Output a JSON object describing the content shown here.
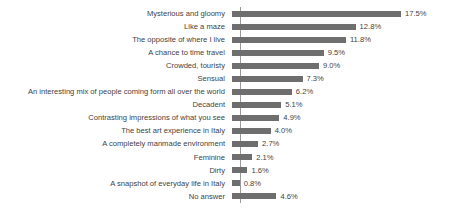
{
  "chart_data": {
    "type": "bar",
    "orientation": "horizontal",
    "title": "",
    "subtitle": "",
    "xlabel": "",
    "ylabel": "",
    "grid": false,
    "legend": false,
    "axis_line": "vertical-left-only",
    "value_label_suffix": "%",
    "xlim": [
      0,
      17.5
    ],
    "bar_color": "#6e6e6e",
    "axis_color": "#9a9a9a",
    "text_color": "#3f3f3f",
    "background": "#ffffff",
    "categories": [
      "Mysterious and gloomy",
      "Like a maze",
      "The opposite of where I live",
      "A chance to time travel",
      "Crowded, touristy",
      "Sensual",
      "An interesting mix of people coming form all over the world",
      "Decadent",
      "Contrasting impressions of what you see",
      "The best art experience in Italy",
      "A completely manmade environment",
      "Feminine",
      "Dirty",
      "A snapshot of everyday life in Italy",
      "No answer"
    ],
    "values": [
      17.5,
      12.8,
      11.8,
      9.5,
      9.0,
      7.3,
      6.2,
      5.1,
      4.9,
      4.0,
      2.7,
      2.1,
      1.6,
      0.8,
      4.6
    ],
    "value_labels": [
      "17.5%",
      "12.8%",
      "11.8%",
      "9.5%",
      "9.0%",
      "7.3%",
      "6.2%",
      "5.1%",
      "4.9%",
      "4.0%",
      "2.7%",
      "2.1%",
      "1.6%",
      "0.8%",
      "4.6%"
    ]
  }
}
